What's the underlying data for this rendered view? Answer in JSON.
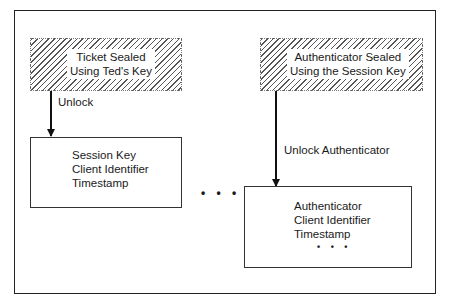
{
  "diagram": {
    "sealed_ticket": {
      "line1": "Ticket Sealed",
      "line2": "Using Ted's Key"
    },
    "sealed_authenticator": {
      "line1": "Authenticator Sealed",
      "line2": "Using the Session Key"
    },
    "arrow_left_label": "Unlock",
    "arrow_right_label": "Unlock Authenticator",
    "ticket_contents": [
      "Session Key",
      "Client Identifier",
      "Timestamp"
    ],
    "authenticator_contents": [
      "Authenticator",
      "Client Identifier",
      "Timestamp"
    ],
    "authenticator_more": "• • •",
    "middle_ellipsis": "• • •"
  }
}
